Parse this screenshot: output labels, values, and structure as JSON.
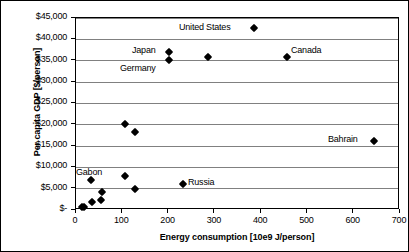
{
  "chart_data": {
    "type": "scatter",
    "title": "",
    "xlabel": "Energy consumption [10e9 J/person]",
    "ylabel": "Per capita GDP [$/person]",
    "xlim": [
      0,
      700
    ],
    "ylim": [
      0,
      45000
    ],
    "grid": "horizontal",
    "legend": "none",
    "marker_style": "black-diamond",
    "xticks": [
      "0",
      "100",
      "200",
      "300",
      "400",
      "500",
      "600",
      "700"
    ],
    "xtick_values": [
      0,
      100,
      200,
      300,
      400,
      500,
      600,
      700
    ],
    "yticks": [
      "$-",
      "$5,000",
      "$10,000",
      "$15,000",
      "$20,000",
      "$25,000",
      "$30,000",
      "$35,000",
      "$40,000",
      "$45,000"
    ],
    "ytick_values": [
      0,
      5000,
      10000,
      15000,
      20000,
      25000,
      30000,
      35000,
      40000,
      45000
    ],
    "points": [
      {
        "x": 385,
        "y": 42650,
        "label": "United States",
        "label_pos": "left"
      },
      {
        "x": 456,
        "y": 35850,
        "label": "Canada",
        "label_pos": "right"
      },
      {
        "x": 644,
        "y": 16150,
        "label": "Bahrain",
        "label_pos": "left"
      },
      {
        "x": 201,
        "y": 37050,
        "label": "Japan",
        "label_pos": "left"
      },
      {
        "x": 201,
        "y": 35150,
        "label": "Germany",
        "label_pos": "below-left"
      },
      {
        "x": 285,
        "y": 35850,
        "label": "",
        "label_pos": ""
      },
      {
        "x": 106,
        "y": 20150,
        "label": "",
        "label_pos": ""
      },
      {
        "x": 128,
        "y": 18250,
        "label": "",
        "label_pos": ""
      },
      {
        "x": 32,
        "y": 7050,
        "label": "Gabon",
        "label_pos": "above-right"
      },
      {
        "x": 106,
        "y": 7900,
        "label": "",
        "label_pos": ""
      },
      {
        "x": 231,
        "y": 6100,
        "label": "Russia",
        "label_pos": "right"
      },
      {
        "x": 56,
        "y": 4300,
        "label": "",
        "label_pos": ""
      },
      {
        "x": 128,
        "y": 4900,
        "label": "",
        "label_pos": ""
      },
      {
        "x": 53,
        "y": 2450,
        "label": "",
        "label_pos": ""
      },
      {
        "x": 34,
        "y": 1850,
        "label": "",
        "label_pos": ""
      },
      {
        "x": 18,
        "y": 750,
        "label": "",
        "label_pos": ""
      },
      {
        "x": 14,
        "y": 600,
        "label": "",
        "label_pos": ""
      }
    ],
    "annotations": [
      {
        "text": "United States",
        "x_px": 178,
        "y_px": 21
      },
      {
        "text": "Canada",
        "x_px": 290,
        "y_px": 44
      },
      {
        "text": "Bahrain",
        "x_px": 327,
        "y_px": 133
      },
      {
        "text": "Japan",
        "x_px": 131,
        "y_px": 44
      },
      {
        "text": "Germany",
        "x_px": 119,
        "y_px": 62
      },
      {
        "text": "Gabon",
        "x_px": 75,
        "y_px": 166
      },
      {
        "text": "Russia",
        "x_px": 187,
        "y_px": 176
      }
    ]
  }
}
